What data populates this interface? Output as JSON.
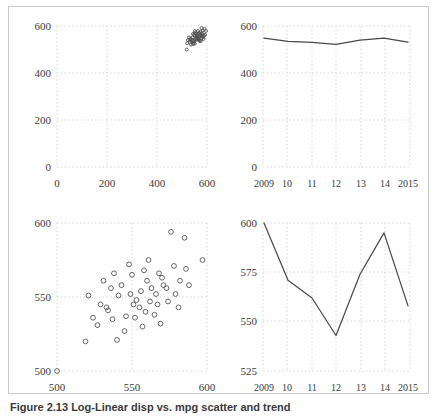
{
  "figure": {
    "caption": "Figure 2.13 Log-Linear disp vs. mpg scatter and trend",
    "border_color": "#c9c9c9",
    "grid_color": "#d7d7d7",
    "line_color": "#4a4a4a",
    "marker_color": "#4c4c4c"
  },
  "chart_data": [
    {
      "panel": "top-left",
      "type": "scatter",
      "title": "",
      "xlabel": "",
      "ylabel": "",
      "xlim": [
        0,
        600
      ],
      "ylim": [
        0,
        600
      ],
      "xticks": [
        0,
        200,
        400,
        600
      ],
      "yticks": [
        0,
        200,
        400,
        600
      ],
      "xticklabels": [
        "0",
        "200",
        "400",
        "600"
      ],
      "yticklabels": [
        "0",
        "200",
        "400",
        "600"
      ],
      "grid": true,
      "legend": "none",
      "points": [
        [
          519,
          500
        ],
        [
          521,
          527
        ],
        [
          531,
          533
        ],
        [
          524,
          540
        ],
        [
          533,
          541
        ],
        [
          528,
          551
        ],
        [
          535,
          546
        ],
        [
          541,
          551
        ],
        [
          538,
          537
        ],
        [
          543,
          538
        ],
        [
          547,
          529
        ],
        [
          536,
          521
        ],
        [
          544,
          524
        ],
        [
          551,
          525
        ],
        [
          549,
          536
        ],
        [
          552,
          543
        ],
        [
          551,
          559
        ],
        [
          544,
          566
        ],
        [
          548,
          562
        ],
        [
          554,
          572
        ],
        [
          551,
          578
        ],
        [
          557,
          568
        ],
        [
          560,
          563
        ],
        [
          562,
          559
        ],
        [
          558,
          555
        ],
        [
          563,
          548
        ],
        [
          556,
          546
        ],
        [
          560,
          542
        ],
        [
          566,
          544
        ],
        [
          569,
          540
        ],
        [
          571,
          536
        ],
        [
          566,
          552
        ],
        [
          570,
          556
        ],
        [
          573,
          562
        ],
        [
          568,
          571
        ],
        [
          575,
          574
        ],
        [
          564,
          578
        ],
        [
          579,
          568
        ],
        [
          582,
          565
        ],
        [
          580,
          558
        ],
        [
          584,
          553
        ],
        [
          578,
          548
        ],
        [
          586,
          545
        ],
        [
          589,
          558
        ],
        [
          583,
          581
        ],
        [
          578,
          591
        ],
        [
          590,
          588
        ],
        [
          596,
          579
        ],
        [
          592,
          563
        ],
        [
          575,
          536
        ]
      ]
    },
    {
      "panel": "top-right",
      "type": "line",
      "title": "",
      "xlabel": "",
      "ylabel": "",
      "xlim": [
        2009,
        2015
      ],
      "ylim": [
        0,
        600
      ],
      "xticks": [
        2009,
        2010,
        2011,
        2012,
        2013,
        2014,
        2015
      ],
      "yticks": [
        0,
        200,
        400,
        600
      ],
      "xticklabels": [
        "2009",
        "10",
        "11",
        "12",
        "13",
        "14",
        "2015"
      ],
      "yticklabels": [
        "0",
        "200",
        "400",
        "600"
      ],
      "grid": true,
      "legend": "none",
      "x": [
        2009,
        2010,
        2011,
        2012,
        2013,
        2014,
        2015
      ],
      "values": [
        548,
        535,
        530,
        522,
        540,
        548,
        531
      ]
    },
    {
      "panel": "bottom-left",
      "type": "scatter",
      "title": "",
      "xlabel": "",
      "ylabel": "",
      "xlim": [
        500,
        600
      ],
      "ylim": [
        500,
        600
      ],
      "xticks": [
        500,
        550,
        600
      ],
      "yticks": [
        500,
        550,
        600
      ],
      "xticklabels": [
        "500",
        "550",
        "600"
      ],
      "yticklabels": [
        "500",
        "550",
        "600"
      ],
      "grid": true,
      "legend": "none",
      "points": [
        [
          500,
          500
        ],
        [
          519,
          520
        ],
        [
          524,
          536
        ],
        [
          527,
          531
        ],
        [
          521,
          551
        ],
        [
          529,
          545
        ],
        [
          533,
          543
        ],
        [
          531,
          561
        ],
        [
          536,
          556
        ],
        [
          534,
          541
        ],
        [
          537,
          535
        ],
        [
          540,
          521
        ],
        [
          538,
          566
        ],
        [
          541,
          551
        ],
        [
          543,
          558
        ],
        [
          546,
          537
        ],
        [
          545,
          527
        ],
        [
          548,
          572
        ],
        [
          550,
          565
        ],
        [
          549,
          552
        ],
        [
          551,
          545
        ],
        [
          553,
          548
        ],
        [
          552,
          536
        ],
        [
          556,
          554
        ],
        [
          555,
          543
        ],
        [
          558,
          568
        ],
        [
          557,
          530
        ],
        [
          560,
          561
        ],
        [
          559,
          540
        ],
        [
          562,
          547
        ],
        [
          563,
          556
        ],
        [
          561,
          575
        ],
        [
          566,
          552
        ],
        [
          565,
          538
        ],
        [
          568,
          566
        ],
        [
          567,
          545
        ],
        [
          570,
          563
        ],
        [
          571,
          558
        ],
        [
          569,
          532
        ],
        [
          574,
          547
        ],
        [
          573,
          556
        ],
        [
          576,
          594
        ],
        [
          578,
          571
        ],
        [
          579,
          552
        ],
        [
          582,
          561
        ],
        [
          581,
          543
        ],
        [
          585,
          590
        ],
        [
          588,
          558
        ],
        [
          586,
          569
        ],
        [
          597,
          575
        ]
      ]
    },
    {
      "panel": "bottom-right",
      "type": "line",
      "title": "",
      "xlabel": "",
      "ylabel": "",
      "xlim": [
        2009,
        2015
      ],
      "ylim": [
        525,
        600
      ],
      "xticks": [
        2009,
        2010,
        2011,
        2012,
        2013,
        2014,
        2015
      ],
      "yticks": [
        525,
        550,
        575,
        600
      ],
      "xticklabels": [
        "2009",
        "10",
        "11",
        "12",
        "13",
        "14",
        "2015"
      ],
      "yticklabels": [
        "525",
        "550",
        "575",
        "600"
      ],
      "grid": true,
      "legend": "none",
      "x": [
        2009,
        2010,
        2011,
        2012,
        2013,
        2014,
        2015
      ],
      "values": [
        600,
        571,
        562,
        543,
        574,
        595,
        558
      ]
    }
  ]
}
